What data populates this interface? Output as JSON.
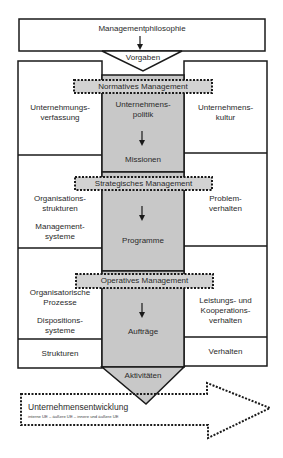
{
  "diagram": {
    "title": "Managementphilosophie",
    "vorgaben": "Vorgaben",
    "banners": {
      "normative": "Normatives Management",
      "strategic": "Strategisches Management",
      "operative": "Operatives Management"
    },
    "center_column": {
      "normative_top": "Unternehmens-",
      "normative_top2": "politik",
      "normative_bottom": "Missionen",
      "strategic_bottom": "Programme",
      "operative_bottom": "Aufträge",
      "output": "Aktivitäten"
    },
    "left_column": {
      "normative_1": "Unternehmungs-",
      "normative_2": "verfassung",
      "strategic_1": "Organisations-",
      "strategic_2": "strukturen",
      "strategic_3": "Management-",
      "strategic_4": "systeme",
      "operative_1": "Organisatorische",
      "operative_2": "Prozesse",
      "operative_3": "Dispositions-",
      "operative_4": "systeme",
      "footer": "Strukturen"
    },
    "right_column": {
      "normative_1": "Unternehmens-",
      "normative_2": "kultur",
      "strategic_1": "Problem-",
      "strategic_2": "verhalten",
      "operative_1": "Leistungs- und",
      "operative_2": "Kooperations-",
      "operative_3": "verhalten",
      "footer": "Verhalten"
    },
    "development_arrow": {
      "title": "Unternehmensentwicklung",
      "subtitle": "interne UE – äußere UE – innere und äußere UE"
    },
    "colors": {
      "line": "#1a1a1a",
      "gray_fill": "#c8c8c8",
      "banner_fill": "#d2d2d2",
      "background": "#ffffff"
    }
  }
}
